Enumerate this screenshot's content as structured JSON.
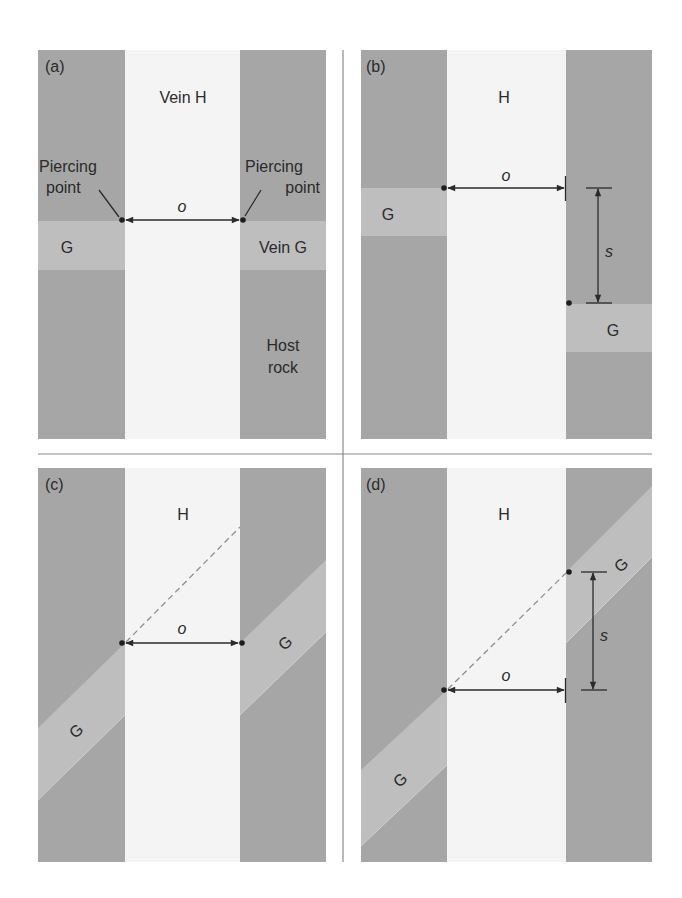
{
  "figure": {
    "colors": {
      "host_rock": "#a6a6a6",
      "vein_g": "#bebebe",
      "vein_h": "#f4f4f4",
      "lines": "#2b2b2b",
      "dashed": "#8f8f8f"
    },
    "panels": [
      {
        "id": "a",
        "label": "(a)",
        "vein_h_label": "Vein H",
        "piercing_left_line1": "Piercing",
        "piercing_left_line2": "point",
        "piercing_right_line1": "Piercing",
        "piercing_right_line2": "point",
        "offset_label": "o",
        "g_left_label": "G",
        "g_right_label": "Vein G",
        "host_line1": "Host",
        "host_line2": "rock"
      },
      {
        "id": "b",
        "label": "(b)",
        "vein_h_label": "H",
        "offset_label": "o",
        "separation_label": "s",
        "g_left_label": "G",
        "g_right_label": "G"
      },
      {
        "id": "c",
        "label": "(c)",
        "vein_h_label": "H",
        "offset_label": "o",
        "g_left_label": "G",
        "g_right_label": "G"
      },
      {
        "id": "d",
        "label": "(d)",
        "vein_h_label": "H",
        "offset_label": "o",
        "separation_label": "s",
        "g_left_label": "G",
        "g_right_label": "G"
      }
    ]
  }
}
